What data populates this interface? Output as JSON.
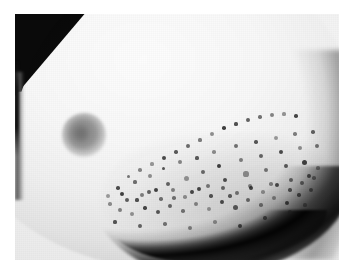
{
  "figure": {
    "kind": "clinical-photograph",
    "modality": "grayscale photograph",
    "view": "lateral oblique",
    "title": "",
    "caption": "",
    "label": "",
    "visible_text": []
  },
  "canvas": {
    "width_px": 354,
    "height_px": 273,
    "background_color": "#ffffff",
    "border_style": "white photographic margin"
  },
  "plate": {
    "left_px": 15,
    "top_px": 14,
    "width_px": 324,
    "height_px": 246,
    "base_tone": "#f1f1f1"
  },
  "regions": [
    {
      "name": "background-wedge",
      "description": "dark triangular background in upper-left corner",
      "color": "#0a0a0a",
      "location": "top-left"
    },
    {
      "name": "left-dark-strip",
      "description": "narrow dark vertical band along the left margin",
      "color": "#161616",
      "location": "left-edge"
    },
    {
      "name": "breast-body",
      "description": "large smooth brightly lit breast surface",
      "color": "#f8f8f8",
      "location": "center"
    },
    {
      "name": "areola-nipple",
      "description": "round grey areola with central nipple",
      "color": "#7d7d7d",
      "location": "left-of-center",
      "center_px": [
        82,
        135
      ],
      "diameter_px": 44
    },
    {
      "name": "peau-dorange-field",
      "description": "dulled skin field with dilated follicular pits (orange-peel skin)",
      "color": "#b4b4b4",
      "location": "lower-right quadrant"
    },
    {
      "name": "inframammary-shadow",
      "description": "deep dark crescent shadow under the inferior breast contour",
      "color": "#050505",
      "location": "bottom"
    },
    {
      "name": "lateral-contour-shadow",
      "description": "soft grey shading along the lateral breast contour",
      "color": "#6b6b6b",
      "location": "right"
    }
  ],
  "palette": {
    "paper_white": "#ffffff",
    "highlight": "#fdfdfd",
    "film_base": "#f1f1f1",
    "midtone": "#b4b4b4",
    "areola_grey": "#7d7d7d",
    "shadow": "#2a2a2a",
    "deep_black": "#070707",
    "speckle": "#1e1e1e"
  },
  "speckles": {
    "count": 96,
    "description": "dark punctate follicular openings concentrated over the lower-right breast",
    "color": "#1e1e1e",
    "points": [
      [
        108,
        196,
        2.1
      ],
      [
        118,
        188,
        1.7
      ],
      [
        127,
        200,
        2.3
      ],
      [
        135,
        182,
        1.6
      ],
      [
        142,
        195,
        2.0
      ],
      [
        150,
        176,
        1.9
      ],
      [
        156,
        190,
        2.4
      ],
      [
        163,
        168,
        1.5
      ],
      [
        168,
        184,
        2.2
      ],
      [
        174,
        198,
        1.8
      ],
      [
        180,
        162,
        2.0
      ],
      [
        186,
        178,
        2.5
      ],
      [
        192,
        192,
        1.9
      ],
      [
        197,
        158,
        1.6
      ],
      [
        203,
        172,
        2.3
      ],
      [
        208,
        186,
        2.1
      ],
      [
        214,
        152,
        1.8
      ],
      [
        219,
        166,
        2.4
      ],
      [
        225,
        180,
        2.0
      ],
      [
        230,
        196,
        1.7
      ],
      [
        236,
        146,
        2.2
      ],
      [
        241,
        160,
        1.9
      ],
      [
        246,
        174,
        2.6
      ],
      [
        251,
        188,
        2.0
      ],
      [
        256,
        142,
        1.7
      ],
      [
        261,
        156,
        2.3
      ],
      [
        266,
        170,
        2.1
      ],
      [
        271,
        184,
        1.8
      ],
      [
        276,
        138,
        2.0
      ],
      [
        281,
        152,
        2.4
      ],
      [
        286,
        166,
        1.9
      ],
      [
        291,
        180,
        2.2
      ],
      [
        295,
        134,
        1.7
      ],
      [
        300,
        148,
        2.1
      ],
      [
        304,
        162,
        2.5
      ],
      [
        309,
        176,
        1.9
      ],
      [
        313,
        132,
        1.8
      ],
      [
        317,
        146,
        2.2
      ],
      [
        120,
        210,
        1.9
      ],
      [
        132,
        214,
        2.2
      ],
      [
        145,
        208,
        1.7
      ],
      [
        158,
        212,
        2.4
      ],
      [
        170,
        206,
        2.0
      ],
      [
        183,
        211,
        1.8
      ],
      [
        196,
        204,
        2.3
      ],
      [
        209,
        209,
        2.1
      ],
      [
        222,
        202,
        1.9
      ],
      [
        235,
        207,
        2.5
      ],
      [
        248,
        200,
        2.0
      ],
      [
        261,
        205,
        1.8
      ],
      [
        274,
        198,
        2.2
      ],
      [
        287,
        203,
        2.0
      ],
      [
        299,
        195,
        1.7
      ],
      [
        311,
        190,
        2.3
      ],
      [
        128,
        176,
        1.5
      ],
      [
        140,
        170,
        1.8
      ],
      [
        152,
        164,
        1.6
      ],
      [
        164,
        158,
        2.0
      ],
      [
        176,
        152,
        1.7
      ],
      [
        188,
        146,
        1.9
      ],
      [
        200,
        140,
        1.6
      ],
      [
        212,
        134,
        2.1
      ],
      [
        224,
        128,
        1.8
      ],
      [
        236,
        124,
        1.6
      ],
      [
        248,
        120,
        1.9
      ],
      [
        260,
        117,
        1.7
      ],
      [
        272,
        115,
        2.0
      ],
      [
        284,
        114,
        1.6
      ],
      [
        296,
        116,
        1.8
      ],
      [
        115,
        222,
        1.6
      ],
      [
        140,
        226,
        1.9
      ],
      [
        165,
        224,
        1.7
      ],
      [
        190,
        228,
        2.0
      ],
      [
        215,
        222,
        1.8
      ],
      [
        240,
        226,
        2.1
      ],
      [
        265,
        218,
        1.7
      ],
      [
        290,
        212,
        1.9
      ],
      [
        305,
        205,
        1.6
      ],
      [
        110,
        204,
        1.7
      ],
      [
        122,
        194,
        2.0
      ],
      [
        137,
        200,
        1.6
      ],
      [
        149,
        192,
        1.9
      ],
      [
        161,
        199,
        1.7
      ],
      [
        173,
        190,
        2.1
      ],
      [
        185,
        197,
        1.8
      ],
      [
        199,
        189,
        2.0
      ],
      [
        211,
        196,
        1.7
      ],
      [
        223,
        188,
        2.2
      ],
      [
        237,
        193,
        1.9
      ],
      [
        250,
        186,
        2.1
      ],
      [
        263,
        192,
        1.8
      ],
      [
        277,
        185,
        2.0
      ],
      [
        290,
        190,
        1.7
      ],
      [
        302,
        183,
        1.9
      ],
      [
        314,
        178,
        1.8
      ],
      [
        318,
        168,
        1.6
      ]
    ]
  }
}
